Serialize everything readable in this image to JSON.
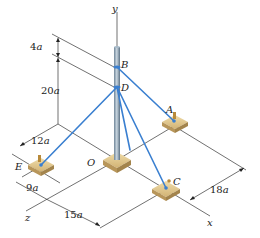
{
  "figure": {
    "axes": {
      "y": "y",
      "x": "x",
      "z": "z"
    },
    "points": {
      "origin": "O",
      "B": "B",
      "D": "D",
      "A": "A",
      "C": "C",
      "E": "E"
    },
    "dimensions": {
      "BD_above": "4",
      "D_height": "20",
      "E_x_offset": "12",
      "E_z": "9",
      "C_z": "15",
      "A_C_spacing": "18",
      "unit": "a"
    },
    "colors": {
      "cable": "#3a7fd0",
      "pole": "#8fa3b5",
      "anchor_block": "#d4b878",
      "line": "#333333"
    }
  }
}
